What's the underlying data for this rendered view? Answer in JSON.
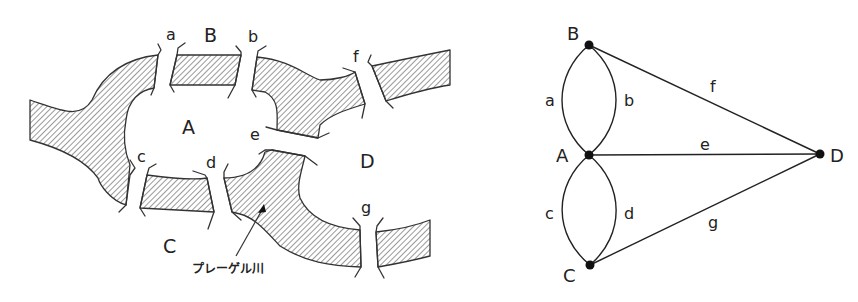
{
  "map": {
    "river_name": "プレーゲル川",
    "land_labels": {
      "A": "A",
      "B": "B",
      "C": "C",
      "D": "D"
    },
    "bridge_labels": {
      "a": "a",
      "b": "b",
      "c": "c",
      "d": "d",
      "e": "e",
      "f": "f",
      "g": "g"
    },
    "colors": {
      "stroke": "#333333",
      "hatch": "#555555",
      "background": "#ffffff"
    }
  },
  "graph": {
    "nodes": [
      {
        "id": "B",
        "label": "B"
      },
      {
        "id": "A",
        "label": "A"
      },
      {
        "id": "C",
        "label": "C"
      },
      {
        "id": "D",
        "label": "D"
      }
    ],
    "edges": [
      {
        "id": "a",
        "label": "a",
        "from": "A",
        "to": "B"
      },
      {
        "id": "b",
        "label": "b",
        "from": "A",
        "to": "B"
      },
      {
        "id": "c",
        "label": "c",
        "from": "A",
        "to": "C"
      },
      {
        "id": "d",
        "label": "d",
        "from": "A",
        "to": "C"
      },
      {
        "id": "e",
        "label": "e",
        "from": "A",
        "to": "D"
      },
      {
        "id": "f",
        "label": "f",
        "from": "B",
        "to": "D"
      },
      {
        "id": "g",
        "label": "g",
        "from": "C",
        "to": "D"
      }
    ],
    "colors": {
      "edge": "#222222",
      "node": "#111111"
    }
  }
}
